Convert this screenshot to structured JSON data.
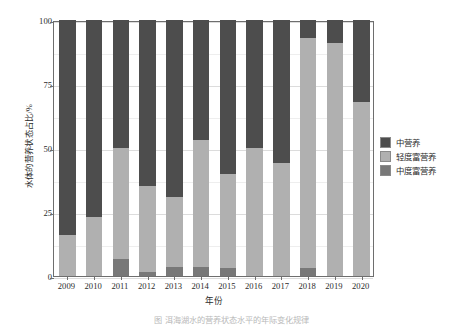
{
  "chart_data": {
    "type": "bar",
    "stacked": true,
    "stack_mode": "percent",
    "title": "",
    "subtitle": "",
    "xlabel": "年份",
    "ylabel": "水体的营养状态占比/%",
    "ylim": [
      0,
      100
    ],
    "yticks": [
      0,
      25,
      50,
      75,
      100
    ],
    "ytick_labels": [
      "0",
      "25",
      "50",
      "75",
      "100"
    ],
    "grid": true,
    "legend_position": "right",
    "categories": [
      "2009",
      "2010",
      "2011",
      "2012",
      "2013",
      "2014",
      "2015",
      "2016",
      "2017",
      "2018",
      "2019",
      "2020"
    ],
    "series": [
      {
        "name": "中营养",
        "color": "#4d4d4d",
        "values": [
          84,
          77,
          50,
          65,
          69,
          47,
          60,
          50,
          56,
          7,
          9,
          32
        ]
      },
      {
        "name": "轻度富营养",
        "color": "#b0b0b0",
        "values": [
          16,
          23,
          43.5,
          33.5,
          27.5,
          49.5,
          37,
          50,
          44,
          90,
          91,
          68
        ]
      },
      {
        "name": "中度富营养",
        "color": "#787878",
        "values": [
          0,
          0,
          6.5,
          1.5,
          3.5,
          3.5,
          3,
          0,
          0,
          3,
          0,
          0
        ]
      }
    ]
  },
  "legend": {
    "entries": [
      {
        "label": "中营养",
        "color": "#4d4d4d"
      },
      {
        "label": "轻度富营养",
        "color": "#b0b0b0"
      },
      {
        "label": "中度富营养",
        "color": "#787878"
      }
    ]
  },
  "axes": {
    "y_title": "水体的营养状态占比/%",
    "x_title": "年份"
  },
  "caption": {
    "text": "图      洱海湖水的营养状态水平的年际变化规律"
  },
  "colors": {
    "frame": "#6e6e6e",
    "grid": "#e4e4e4",
    "background": "#ffffff",
    "text": "#2b2b2b"
  }
}
